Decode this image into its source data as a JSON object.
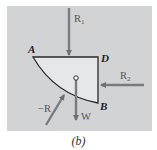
{
  "figure": {
    "caption": "(b)",
    "points": {
      "A": "A",
      "D": "D",
      "B": "B"
    },
    "forces": {
      "R1": {
        "label": "R",
        "sub": "1"
      },
      "R2": {
        "label": "R",
        "sub": "2"
      },
      "negR": {
        "label": "−R"
      },
      "W": {
        "label": "W"
      }
    },
    "colors": {
      "background": "#d2d3d4",
      "body_fill": "#e6e7e8",
      "outline": "#222222",
      "arrow": "#7a7b7d"
    }
  }
}
